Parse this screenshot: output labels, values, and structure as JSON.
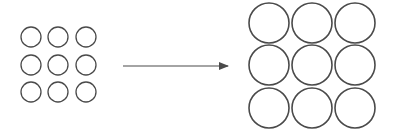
{
  "diagram": {
    "stroke_color": "#4a4a4a",
    "background": "#ffffff",
    "small_grid": {
      "rows": 3,
      "cols": 3,
      "radius": 10,
      "centers_x": [
        31,
        58,
        86
      ],
      "centers_y": [
        37,
        65,
        92
      ]
    },
    "arrow": {
      "x1": 123,
      "y1": 66,
      "x2": 228,
      "y2": 66,
      "direction": "right"
    },
    "large_grid": {
      "rows": 3,
      "cols": 3,
      "radius": 20,
      "centers_x": [
        269,
        312,
        355
      ],
      "centers_y": [
        23,
        65,
        108
      ]
    }
  }
}
